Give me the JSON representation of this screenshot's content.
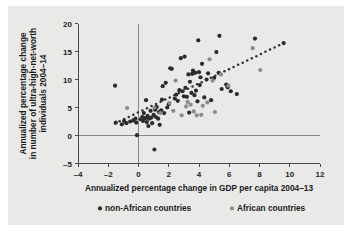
{
  "figure": {
    "background_color": "#e9e9e7",
    "page_color": "#ffffff"
  },
  "axes": {
    "x": {
      "title": "Annualized percentage change in GDP per capita 2004–13",
      "ticks": [
        -4,
        -2,
        0,
        2,
        4,
        6,
        8,
        10,
        12
      ],
      "tick_labels": [
        "–4",
        "–2",
        "0",
        "2",
        "4",
        "6",
        "8",
        "10",
        "12"
      ],
      "min": -4,
      "max": 12
    },
    "y": {
      "title_lines": [
        "Annualized percentage change",
        "in number of ultra-high-net-worth",
        "individuals 2004–14"
      ],
      "ticks": [
        -5,
        0,
        5,
        10,
        15,
        20
      ],
      "tick_labels": [
        "–5",
        "0",
        "5",
        "10",
        "15",
        "20"
      ],
      "min": -5,
      "max": 20
    }
  },
  "legend": {
    "position": "bottom",
    "items": [
      {
        "label": "non-African countries",
        "color": "#2b2b2b",
        "key": "non_african"
      },
      {
        "label": "African countries",
        "color": "#8c8c8c",
        "key": "african"
      }
    ]
  },
  "chart_data": {
    "type": "scatter",
    "title": "",
    "xlabel": "Annualized percentage change in GDP per capita 2004–13",
    "ylabel": "Annualized percentage change in number of ultra-high-net-worth individuals 2004–14",
    "xlim": [
      -4,
      12
    ],
    "ylim": [
      -5,
      20
    ],
    "xticks": [
      -4,
      -2,
      0,
      2,
      4,
      6,
      8,
      10,
      12
    ],
    "yticks": [
      -5,
      0,
      5,
      10,
      15,
      20
    ],
    "grid": false,
    "reference_lines": [
      {
        "orientation": "vertical",
        "value": 0,
        "color": "#7d7d7d"
      },
      {
        "orientation": "horizontal",
        "value": 0,
        "color": "#7d7d7d"
      }
    ],
    "trendline": {
      "style": "dotted",
      "color": "#2f2f2f",
      "x_start": -1.55,
      "y_start": 2.15,
      "x_end": 9.6,
      "y_end": 16.5
    },
    "series": [
      {
        "name": "non-African countries",
        "color": "#2b2b2b",
        "points": [
          [
            -1.55,
            8.9
          ],
          [
            -1.5,
            2.3
          ],
          [
            -1.1,
            2.0
          ],
          [
            -0.95,
            2.6
          ],
          [
            -0.8,
            2.2
          ],
          [
            -0.55,
            2.5
          ],
          [
            -0.35,
            2.7
          ],
          [
            -0.2,
            3.0
          ],
          [
            -0.15,
            2.3
          ],
          [
            -0.1,
            0.05
          ],
          [
            0.15,
            2.9
          ],
          [
            0.25,
            3.3
          ],
          [
            0.3,
            2.6
          ],
          [
            0.35,
            4.0
          ],
          [
            0.45,
            3.1
          ],
          [
            0.5,
            6.3
          ],
          [
            0.55,
            2.4
          ],
          [
            0.6,
            3.5
          ],
          [
            0.65,
            1.7
          ],
          [
            0.7,
            3.0
          ],
          [
            0.8,
            4.4
          ],
          [
            0.85,
            3.2
          ],
          [
            0.9,
            2.2
          ],
          [
            1.0,
            3.7
          ],
          [
            1.05,
            -2.5
          ],
          [
            1.1,
            4.6
          ],
          [
            1.15,
            3.3
          ],
          [
            1.2,
            5.1
          ],
          [
            1.3,
            3.0
          ],
          [
            1.35,
            4.2
          ],
          [
            1.4,
            1.9
          ],
          [
            1.5,
            4.5
          ],
          [
            1.55,
            6.4
          ],
          [
            1.6,
            8.8
          ],
          [
            1.7,
            4.0
          ],
          [
            1.8,
            9.4
          ],
          [
            1.9,
            5.0
          ],
          [
            2.0,
            5.6
          ],
          [
            2.1,
            12.0
          ],
          [
            2.2,
            11.9
          ],
          [
            2.4,
            6.6
          ],
          [
            2.5,
            7.3
          ],
          [
            2.6,
            6.2
          ],
          [
            2.7,
            8.1
          ],
          [
            2.8,
            13.8
          ],
          [
            2.9,
            7.9
          ],
          [
            3.0,
            7.0
          ],
          [
            3.05,
            14.1
          ],
          [
            3.1,
            8.5
          ],
          [
            3.2,
            6.9
          ],
          [
            3.3,
            10.9
          ],
          [
            3.35,
            4.1
          ],
          [
            3.4,
            9.6
          ],
          [
            3.5,
            7.6
          ],
          [
            3.55,
            11.0
          ],
          [
            3.6,
            11.6
          ],
          [
            3.7,
            7.2
          ],
          [
            3.75,
            11.2
          ],
          [
            3.8,
            8.0
          ],
          [
            3.9,
            6.1
          ],
          [
            3.95,
            17.0
          ],
          [
            4.0,
            11.3
          ],
          [
            4.05,
            9.0
          ],
          [
            4.1,
            10.4
          ],
          [
            4.2,
            12.8
          ],
          [
            4.35,
            6.8
          ],
          [
            4.5,
            10.0
          ],
          [
            4.6,
            11.1
          ],
          [
            4.8,
            6.3
          ],
          [
            5.0,
            10.3
          ],
          [
            5.15,
            14.9
          ],
          [
            5.3,
            11.2
          ],
          [
            5.35,
            17.8
          ],
          [
            5.5,
            8.3
          ],
          [
            5.8,
            9.1
          ],
          [
            5.9,
            8.6
          ],
          [
            6.1,
            7.9
          ],
          [
            6.5,
            7.4
          ],
          [
            7.7,
            17.3
          ],
          [
            9.6,
            16.5
          ]
        ]
      },
      {
        "name": "African countries",
        "color": "#8c8c8c",
        "points": [
          [
            -0.75,
            4.9
          ],
          [
            1.45,
            4.0
          ],
          [
            2.05,
            5.8
          ],
          [
            2.3,
            4.4
          ],
          [
            2.85,
            3.6
          ],
          [
            3.15,
            5.2
          ],
          [
            3.45,
            5.5
          ],
          [
            3.65,
            4.3
          ],
          [
            3.85,
            3.6
          ],
          [
            4.15,
            3.7
          ],
          [
            4.55,
            5.9
          ],
          [
            4.7,
            13.6
          ],
          [
            4.9,
            9.8
          ],
          [
            5.05,
            4.2
          ],
          [
            5.45,
            10.9
          ],
          [
            5.95,
            8.9
          ],
          [
            7.55,
            15.6
          ],
          [
            8.05,
            11.7
          ],
          [
            2.45,
            9.8
          ],
          [
            1.05,
            5.0
          ],
          [
            4.25,
            5.3
          ],
          [
            3.25,
            6.0
          ]
        ]
      }
    ]
  }
}
